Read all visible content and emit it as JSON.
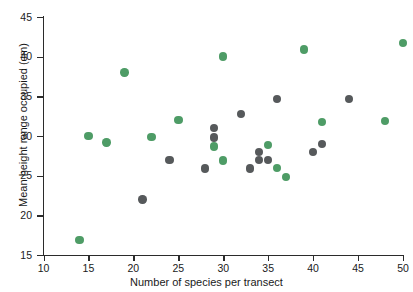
{
  "chart_data": {
    "type": "scatter",
    "title": "",
    "xlabel": "Number of species per transect",
    "ylabel": "Mean height range occupied (cm)",
    "xlim": [
      10,
      50
    ],
    "ylim": [
      15,
      45
    ],
    "xticks": [
      10,
      15,
      20,
      25,
      30,
      35,
      40,
      45,
      50
    ],
    "yticks": [
      15,
      20,
      25,
      30,
      35,
      40,
      45
    ],
    "xtick_labels": [
      "10",
      "15",
      "20",
      "25",
      "30",
      "35",
      "40",
      "45",
      "50"
    ],
    "ytick_labels": [
      "15",
      "20",
      "25",
      "30",
      "35",
      "40",
      "45"
    ],
    "grid": false,
    "legend": null,
    "colors": {
      "green": "#4e9c66",
      "gray": "#56595b"
    },
    "series": [
      {
        "name": "green",
        "color": "#4e9c66",
        "marker": "circle",
        "points": [
          [
            14,
            16.9
          ],
          [
            15,
            30.0
          ],
          [
            17,
            29.2
          ],
          [
            19,
            38.0
          ],
          [
            22,
            29.9
          ],
          [
            25,
            32.0
          ],
          [
            29,
            28.7
          ],
          [
            30,
            40.0
          ],
          [
            30,
            26.9
          ],
          [
            35,
            28.9
          ],
          [
            36,
            26.0
          ],
          [
            37,
            24.8
          ],
          [
            39,
            40.9
          ],
          [
            41,
            31.8
          ],
          [
            48,
            31.9
          ],
          [
            50,
            41.7
          ]
        ]
      },
      {
        "name": "gray",
        "color": "#56595b",
        "marker": "circle",
        "points": [
          [
            21,
            22.0
          ],
          [
            24,
            27.0
          ],
          [
            28,
            25.9
          ],
          [
            29,
            31.0
          ],
          [
            29,
            29.8
          ],
          [
            32,
            32.8
          ],
          [
            33,
            25.9
          ],
          [
            34,
            28.0
          ],
          [
            34,
            27.0
          ],
          [
            35,
            27.0
          ],
          [
            36,
            34.7
          ],
          [
            40,
            28.0
          ],
          [
            41,
            29.0
          ],
          [
            44,
            34.7
          ]
        ]
      }
    ]
  }
}
